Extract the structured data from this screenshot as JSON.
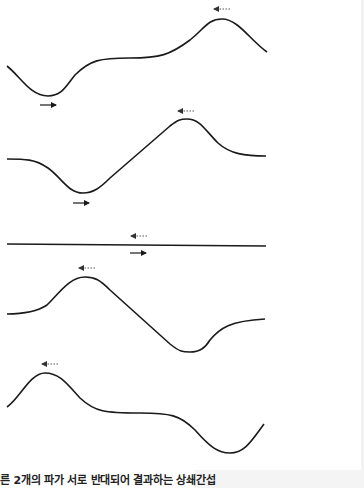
{
  "caption": "른 2개의 파가 서로 반대되어 결과하는 상쇄간섭",
  "colors": {
    "line": "#1a1a1a",
    "dotted_arrow": "#555555",
    "background": "#ffffff"
  },
  "waves": [
    {
      "name": "wave-1",
      "path": "M7,66 C20,76 30,96 48,96 C62,96 66,86 75,75 C90,60 100,58 130,58 C160,58 170,55 190,40 C205,28 208,19 222,19 C238,19 250,40 267,52",
      "arrows": [
        {
          "type": "dotted-left",
          "x1": 230,
          "x2": 214,
          "y": 9
        },
        {
          "type": "solid-right",
          "x1": 40,
          "x2": 56,
          "y": 105
        }
      ]
    },
    {
      "name": "wave-2",
      "path": "M7,159 C25,159 35,159 48,168 C62,178 68,193 83,193 C93,193 100,188 110,178 L170,126 C178,120 180,119 187,119 C200,119 205,130 218,143 C230,154 245,156 266,156",
      "arrows": [
        {
          "type": "dotted-left",
          "x1": 194,
          "x2": 178,
          "y": 111
        },
        {
          "type": "solid-right",
          "x1": 73,
          "x2": 89,
          "y": 203
        }
      ]
    },
    {
      "name": "wave-3-flat",
      "path": "M7,244 L266,246",
      "arrows": [
        {
          "type": "dotted-left",
          "x1": 147,
          "x2": 131,
          "y": 236
        },
        {
          "type": "solid-right",
          "x1": 130,
          "x2": 146,
          "y": 253
        }
      ]
    },
    {
      "name": "wave-4",
      "path": "M7,314 C25,314 38,311 47,305 C60,292 70,277 85,277 C95,277 100,280 110,290 L170,344 C180,352 183,352 190,352 C200,352 205,348 210,340 C220,328 230,321 265,319",
      "arrows": [
        {
          "type": "dotted-left",
          "x1": 95,
          "x2": 79,
          "y": 268
        }
      ]
    },
    {
      "name": "wave-5",
      "path": "M7,407 C20,398 30,373 45,373 C60,373 68,385 80,398 C95,412 105,413 140,413 C170,413 180,415 195,430 C210,447 218,453 230,453 C245,453 252,440 264,424",
      "arrows": [
        {
          "type": "dotted-left",
          "x1": 58,
          "x2": 42,
          "y": 364
        }
      ]
    }
  ]
}
